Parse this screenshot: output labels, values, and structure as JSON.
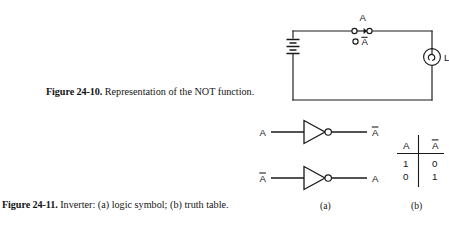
{
  "page": {
    "background": "#ffffff",
    "ink": "#1a1a1a"
  },
  "figure_2410": {
    "caption_label": "Figure 24-10.",
    "caption_text": "Representation of the NOT function.",
    "circuit": {
      "switch_closed_label": "A",
      "switch_open_label": "Ā",
      "lamp_label": "L",
      "components": [
        "battery",
        "switch-spdt",
        "lamp"
      ]
    }
  },
  "figure_2411": {
    "caption_label": "Figure 24-11.",
    "caption_text": "Inverter: (a) logic symbol; (b) truth table.",
    "sublabel_a": "(a)",
    "sublabel_b": "(b)",
    "inverters": [
      {
        "input": "A",
        "output": "Ā"
      },
      {
        "input": "Ā",
        "output": "A"
      }
    ],
    "truth_table": {
      "headers": [
        "A",
        "Ā"
      ],
      "rows": [
        [
          "1",
          "0"
        ],
        [
          "0",
          "1"
        ]
      ]
    }
  }
}
